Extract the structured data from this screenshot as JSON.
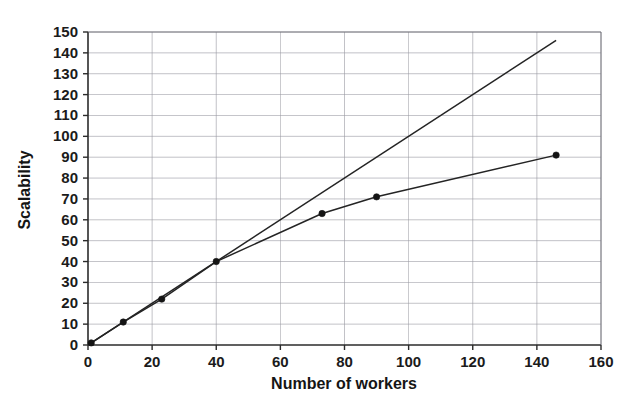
{
  "chart_data": {
    "type": "line",
    "title": "",
    "xlabel": "Number of workers",
    "ylabel": "Scalability",
    "xlim": [
      0,
      160
    ],
    "ylim": [
      0,
      150
    ],
    "xticks": [
      0,
      20,
      40,
      60,
      80,
      100,
      120,
      140,
      160
    ],
    "yticks": [
      0,
      10,
      20,
      30,
      40,
      50,
      60,
      70,
      80,
      90,
      100,
      110,
      120,
      130,
      140,
      150
    ],
    "grid": true,
    "legend": "none",
    "series": [
      {
        "name": "ideal-linear-scalability",
        "markers": false,
        "x": [
          1,
          146
        ],
        "y": [
          1,
          146
        ]
      },
      {
        "name": "measured-scalability",
        "markers": true,
        "x": [
          1,
          11,
          23,
          40,
          73,
          90,
          146
        ],
        "y": [
          1,
          11,
          22,
          40,
          63,
          71,
          91
        ]
      }
    ],
    "colors": {
      "line": "#242424",
      "marker": "#141414",
      "grid": "#9a9aa2",
      "axis": "#2b2b2b",
      "background": "#ffffff"
    }
  },
  "axis": {
    "x_title": "Number of workers",
    "y_title": "Scalability",
    "x_tick_labels": [
      "0",
      "20",
      "40",
      "60",
      "80",
      "100",
      "120",
      "140",
      "160"
    ],
    "y_tick_labels": [
      "0",
      "10",
      "20",
      "30",
      "40",
      "50",
      "60",
      "70",
      "80",
      "90",
      "100",
      "110",
      "120",
      "130",
      "140",
      "150"
    ]
  }
}
